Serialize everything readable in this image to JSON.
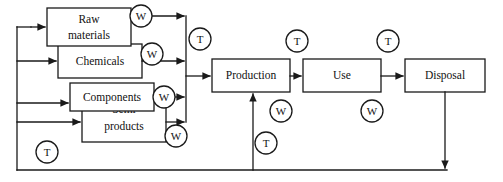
{
  "diagram": {
    "type": "flowchart",
    "background_color": "#ffffff",
    "line_color": "#1a1a1a",
    "text_color": "#111111",
    "stage_boxes": [
      {
        "id": "raw-materials",
        "label_line1": "Raw",
        "label_line2": "materials",
        "x": 47,
        "y": 8,
        "w": 84,
        "h": 38
      },
      {
        "id": "chemicals",
        "label_line1": "Chemicals",
        "label_line2": "",
        "x": 58,
        "y": 44,
        "w": 84,
        "h": 34
      },
      {
        "id": "components",
        "label_line1": "Components",
        "label_line2": "",
        "x": 70,
        "y": 83,
        "w": 84,
        "h": 28
      },
      {
        "id": "semi-products",
        "label_line1": "Semi",
        "label_line2": "products",
        "x": 82,
        "y": 96,
        "w": 84,
        "h": 46
      },
      {
        "id": "production",
        "label_line1": "Production",
        "label_line2": "",
        "x": 212,
        "y": 59,
        "w": 78,
        "h": 33
      },
      {
        "id": "use",
        "label_line1": "Use",
        "label_line2": "",
        "x": 303,
        "y": 59,
        "w": 78,
        "h": 33
      },
      {
        "id": "disposal",
        "label_line1": "Disposal",
        "label_line2": "",
        "x": 405,
        "y": 59,
        "w": 80,
        "h": 33
      }
    ],
    "markers": [
      {
        "id": "w-raw-materials",
        "label": "W",
        "cx": 141,
        "cy": 16,
        "rx": 11,
        "ry": 11
      },
      {
        "id": "w-chemicals",
        "label": "W",
        "cx": 152,
        "cy": 54,
        "rx": 11,
        "ry": 11
      },
      {
        "id": "w-components",
        "label": "W",
        "cx": 164,
        "cy": 97,
        "rx": 11,
        "ry": 11
      },
      {
        "id": "w-semi-products",
        "label": "W",
        "cx": 176,
        "cy": 136,
        "rx": 11,
        "ry": 11
      },
      {
        "id": "t-materials-input",
        "label": "T",
        "cx": 200,
        "cy": 39,
        "rx": 11,
        "ry": 11
      },
      {
        "id": "t-use-input",
        "label": "T",
        "cx": 297,
        "cy": 41,
        "rx": 11,
        "ry": 11
      },
      {
        "id": "t-disposal-input",
        "label": "T",
        "cx": 388,
        "cy": 41,
        "rx": 11,
        "ry": 11
      },
      {
        "id": "w-production",
        "label": "W",
        "cx": 281,
        "cy": 111,
        "rx": 11,
        "ry": 11
      },
      {
        "id": "w-use",
        "label": "W",
        "cx": 372,
        "cy": 111,
        "rx": 11,
        "ry": 11
      },
      {
        "id": "t-recycling-loop",
        "label": "T",
        "cx": 266,
        "cy": 143,
        "rx": 11,
        "ry": 11
      },
      {
        "id": "t-return-left",
        "label": "T",
        "cx": 47,
        "cy": 152,
        "rx": 11,
        "ry": 11
      }
    ],
    "marker_legend": {
      "W": "W",
      "T": "T"
    }
  }
}
